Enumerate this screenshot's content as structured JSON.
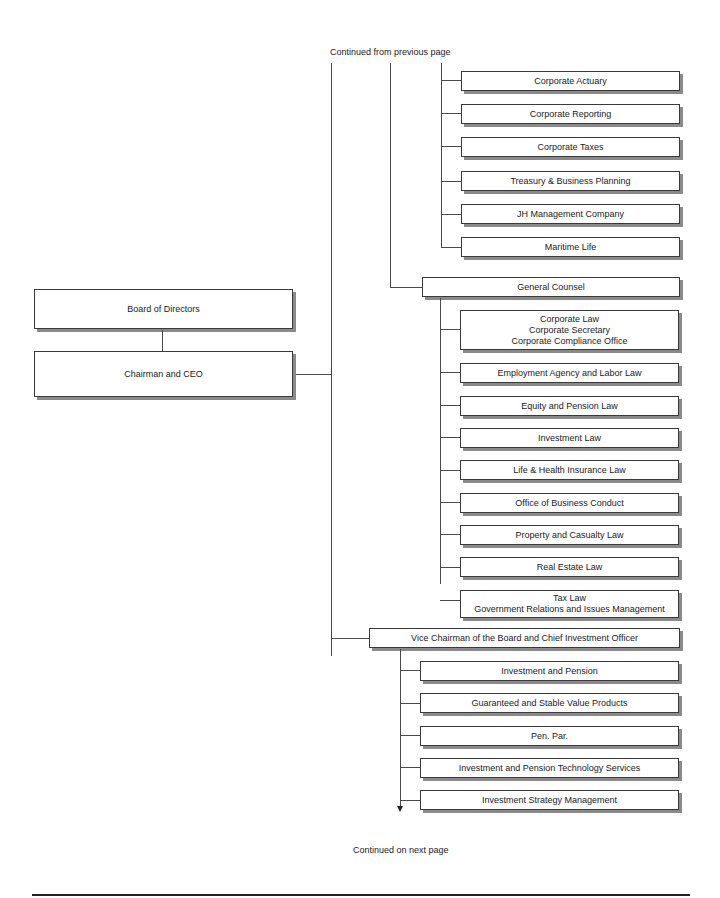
{
  "notes": {
    "continued_from": "Continued from previous page",
    "continued_on": "Continued on next page"
  },
  "left": {
    "board": "Board of Directors",
    "ceo": "Chairman and CEO"
  },
  "finance_group": {
    "items": [
      "Corporate Actuary",
      "Corporate Reporting",
      "Corporate Taxes",
      "Treasury & Business Planning",
      "JH Management Company",
      "Maritime Life"
    ]
  },
  "general_counsel": {
    "title": "General Counsel",
    "items": [
      {
        "lines": [
          "Corporate Law",
          "Corporate Secretary",
          "Corporate Compliance Office"
        ]
      },
      {
        "lines": [
          "Employment Agency and Labor Law"
        ]
      },
      {
        "lines": [
          "Equity and Pension Law"
        ]
      },
      {
        "lines": [
          "Investment Law"
        ]
      },
      {
        "lines": [
          "Life & Health Insurance Law"
        ]
      },
      {
        "lines": [
          "Office of Business Conduct"
        ]
      },
      {
        "lines": [
          "Property and Casualty Law"
        ]
      },
      {
        "lines": [
          "Real Estate Law"
        ]
      },
      {
        "lines": [
          "Tax Law",
          "Government Relations and Issues Management"
        ]
      }
    ]
  },
  "vice_chairman": {
    "title": "Vice Chairman of the Board and Chief Investment Officer",
    "items": [
      "Investment and Pension",
      "Guaranteed and Stable Value Products",
      "Pen. Par.",
      "Investment and Pension Technology Services",
      "Investment Strategy Management"
    ]
  }
}
